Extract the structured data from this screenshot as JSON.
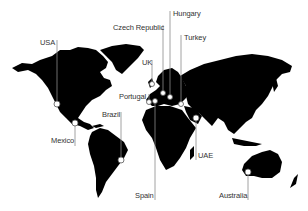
{
  "map": {
    "type": "world-map",
    "land_color": "#000000",
    "background_color": "#ffffff",
    "marker_fill": "#ffffff",
    "leader_color": "#8a8a8a"
  },
  "locations": [
    {
      "name": "USA",
      "label_x": 40,
      "label_y": 40,
      "line_x": 57,
      "line_top": 40,
      "marker_x": 57,
      "marker_y": 104
    },
    {
      "name": "Mexico",
      "label_x": 51,
      "label_y": 138,
      "line_x": 75,
      "line_top": 123,
      "marker_x": 75,
      "marker_y": 123
    },
    {
      "name": "Brazil",
      "label_x": 102,
      "label_y": 112,
      "line_x": 121,
      "line_top": 112,
      "marker_x": 121,
      "marker_y": 160
    },
    {
      "name": "Czech Republic",
      "label_x": 113,
      "label_y": 25,
      "line_x": 163,
      "line_top": 25,
      "marker_x": 163,
      "marker_y": 93
    },
    {
      "name": "Hungary",
      "label_x": 173,
      "label_y": 11,
      "line_x": 170,
      "line_top": 11,
      "marker_x": 170,
      "marker_y": 97
    },
    {
      "name": "Turkey",
      "label_x": 184,
      "label_y": 35,
      "line_x": 181,
      "line_top": 35,
      "marker_x": 181,
      "marker_y": 104
    },
    {
      "name": "UK",
      "label_x": 142,
      "label_y": 60,
      "line_x": 152,
      "line_top": 60,
      "marker_x": 152,
      "marker_y": 84
    },
    {
      "name": "Portugal",
      "label_x": 119,
      "label_y": 94,
      "line_x": 149,
      "line_top": 94,
      "marker_x": 149,
      "marker_y": 102
    },
    {
      "name": "Spain",
      "label_x": 135,
      "label_y": 193,
      "line_x": 155,
      "line_top": 101,
      "marker_x": 155,
      "marker_y": 101
    },
    {
      "name": "UAE",
      "label_x": 198,
      "label_y": 153,
      "line_x": 196,
      "line_top": 118,
      "marker_x": 196,
      "marker_y": 118
    },
    {
      "name": "Australia",
      "label_x": 219,
      "label_y": 193,
      "line_x": 248,
      "line_top": 172,
      "marker_x": 248,
      "marker_y": 172
    }
  ]
}
